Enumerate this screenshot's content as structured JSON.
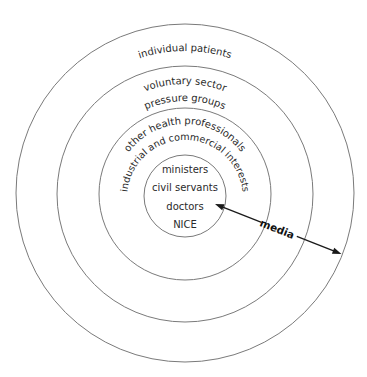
{
  "diagram": {
    "type": "concentric-circles",
    "title": "",
    "rings": [
      {
        "id": "outer",
        "labels": [
          "individual patients"
        ]
      },
      {
        "id": "second",
        "labels": [
          "voluntary sector",
          "pressure groups"
        ]
      },
      {
        "id": "third",
        "labels": [
          "other health professionals",
          "industrial and commercial interests"
        ]
      },
      {
        "id": "core",
        "labels": [
          "ministers",
          "civil servants",
          "doctors",
          "NICE"
        ]
      }
    ],
    "arrow": {
      "label": "media",
      "style": "double-headed",
      "from": "core",
      "to": "outer"
    },
    "colors": {
      "ring_stroke": "#7a7a7a",
      "text": "#2a2a2a",
      "arrow": "#1a1a1a"
    }
  }
}
